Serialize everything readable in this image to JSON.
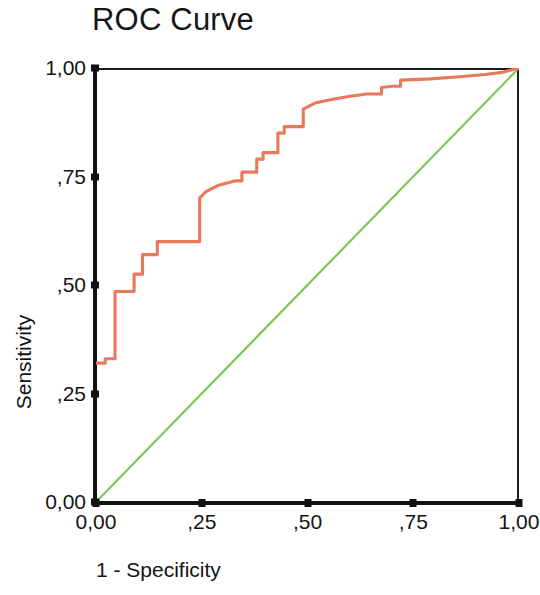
{
  "chart_data": {
    "type": "line",
    "title": "ROC Curve",
    "xlabel": "1 - Specificity",
    "ylabel": "Sensitivity",
    "xlim": [
      0,
      1
    ],
    "ylim": [
      0,
      1
    ],
    "grid": false,
    "legend": "none",
    "xticks": [
      "0,00",
      ",25",
      ",50",
      ",75",
      "1,00"
    ],
    "xtick_values": [
      0,
      0.25,
      0.5,
      0.75,
      1
    ],
    "yticks": [
      "0,00",
      ",25",
      ",50",
      ",75",
      "1,00"
    ],
    "ytick_values": [
      0,
      0.25,
      0.5,
      0.75,
      1
    ],
    "decimal_separator": ",",
    "series": [
      {
        "name": "ROC curve",
        "color": "#E8795A",
        "style": "step",
        "x": [
          0.0,
          0.022,
          0.022,
          0.045,
          0.045,
          0.09,
          0.09,
          0.11,
          0.11,
          0.145,
          0.145,
          0.245,
          0.245,
          0.26,
          0.29,
          0.33,
          0.345,
          0.345,
          0.38,
          0.38,
          0.395,
          0.395,
          0.43,
          0.43,
          0.445,
          0.445,
          0.49,
          0.49,
          0.52,
          0.56,
          0.6,
          0.64,
          0.675,
          0.675,
          0.7,
          0.72,
          0.72,
          0.79,
          0.86,
          0.92,
          0.96,
          1.0
        ],
        "y": [
          0.32,
          0.32,
          0.33,
          0.33,
          0.485,
          0.485,
          0.525,
          0.525,
          0.57,
          0.57,
          0.6,
          0.6,
          0.7,
          0.715,
          0.73,
          0.74,
          0.74,
          0.76,
          0.76,
          0.79,
          0.79,
          0.805,
          0.805,
          0.85,
          0.85,
          0.865,
          0.865,
          0.905,
          0.92,
          0.928,
          0.935,
          0.94,
          0.94,
          0.955,
          0.958,
          0.958,
          0.972,
          0.975,
          0.98,
          0.985,
          0.99,
          1.0
        ]
      },
      {
        "name": "Reference line",
        "color": "#7DC855",
        "style": "straight",
        "x": [
          0,
          1
        ],
        "y": [
          0,
          1
        ]
      }
    ]
  },
  "axes": {
    "x_title": "1 - Specificity",
    "y_title": "Sensitivity"
  },
  "colors": {
    "roc": "#E8795A",
    "reference": "#7DC855",
    "axis": "#111111",
    "frame": "#1b1b1b",
    "text": "#141414",
    "background": "#ffffff"
  }
}
